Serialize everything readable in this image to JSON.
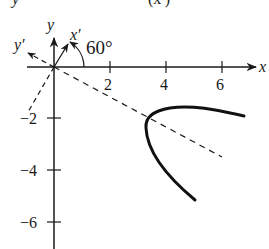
{
  "top_fragment": {
    "text_left": "y",
    "text_right": "(x′)"
  },
  "diagram": {
    "x_axis_label": "x",
    "y_axis_label": "y",
    "rotated_x_label": "x′",
    "rotated_y_label": "y′",
    "angle_label": "60°",
    "x_ticks": [
      "2",
      "4",
      "6"
    ],
    "y_ticks": [
      "−2",
      "−4",
      "−6"
    ],
    "colors": {
      "ink": "#1a1a1a",
      "background": "#ffffff"
    }
  }
}
